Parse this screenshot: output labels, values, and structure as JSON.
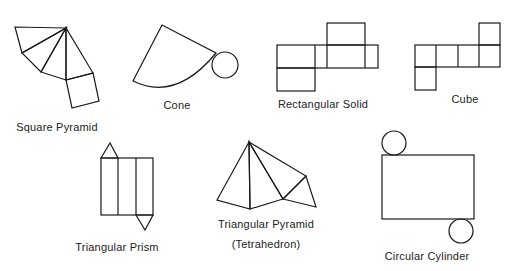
{
  "nets": [
    {
      "id": "square-pyramid",
      "label": "Square Pyramid"
    },
    {
      "id": "cone",
      "label": "Cone"
    },
    {
      "id": "rectangular-solid",
      "label": "Rectangular  Solid"
    },
    {
      "id": "cube",
      "label": "Cube"
    },
    {
      "id": "triangular-prism",
      "label": "Triangular Prism"
    },
    {
      "id": "triangular-pyramid",
      "label": "Triangular Pyramid",
      "sublabel": "(Tetrahedron)"
    },
    {
      "id": "circular-cylinder",
      "label": "Circular  Cylinder"
    }
  ],
  "colors": {
    "stroke": "#1a1a1a",
    "background": "#ffffff",
    "text": "#222222"
  }
}
